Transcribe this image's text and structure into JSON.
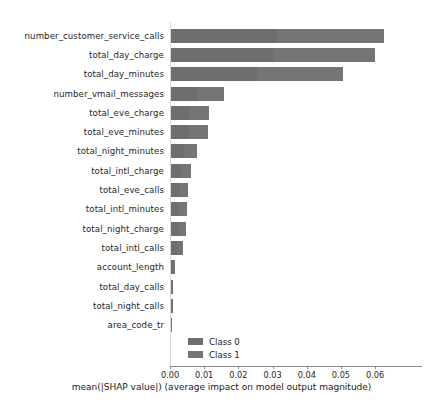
{
  "chart_data": {
    "type": "bar",
    "orientation": "horizontal",
    "stacked": true,
    "title": "",
    "xlabel": "mean(|SHAP value|) (average impact on model output magnitude)",
    "ylabel": "",
    "xlim": [
      0.0,
      0.0737
    ],
    "grid": false,
    "legend_position": "lower-center-left",
    "categories": [
      "number_customer_service_calls",
      "total_day_charge",
      "total_day_minutes",
      "number_vmail_messages",
      "total_eve_charge",
      "total_eve_minutes",
      "total_night_minutes",
      "total_intl_charge",
      "total_eve_calls",
      "total_intl_minutes",
      "total_night_charge",
      "total_intl_calls",
      "account_length",
      "total_day_calls",
      "total_night_calls",
      "area_code_tr"
    ],
    "series": [
      {
        "name": "Class 0",
        "color": "#6e6e6e",
        "values": [
          0.0311,
          0.0298,
          0.0252,
          0.0078,
          0.0056,
          0.0054,
          0.0038,
          0.0029,
          0.0025,
          0.0024,
          0.0022,
          0.0018,
          0.0006,
          0.0004,
          0.0003,
          0.0001
        ]
      },
      {
        "name": "Class 1",
        "color": "#757575",
        "values": [
          0.0311,
          0.0298,
          0.0251,
          0.0077,
          0.0055,
          0.0054,
          0.0038,
          0.0029,
          0.0025,
          0.0023,
          0.0022,
          0.0017,
          0.0006,
          0.0003,
          0.0003,
          0.0001
        ]
      }
    ],
    "totals": [
      0.0622,
      0.0596,
      0.0503,
      0.0155,
      0.0111,
      0.0108,
      0.0076,
      0.0058,
      0.005,
      0.0047,
      0.0044,
      0.0035,
      0.0012,
      0.0007,
      0.0006,
      0.0002
    ],
    "xticks": [
      0.0,
      0.01,
      0.02,
      0.03,
      0.04,
      0.05,
      0.06
    ],
    "xticklabels": [
      "0.00",
      "0.01",
      "0.02",
      "0.03",
      "0.04",
      "0.05",
      "0.06"
    ]
  },
  "legend": {
    "items": [
      {
        "label": "Class 0"
      },
      {
        "label": "Class 1"
      }
    ]
  }
}
